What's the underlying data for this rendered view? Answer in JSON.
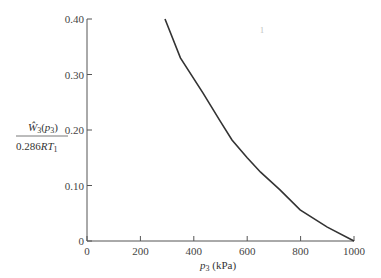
{
  "chart_data": {
    "type": "line",
    "title": "",
    "xlabel": "p3 (kPa)",
    "ylabel": "W3(p3) / 0.286 R T1",
    "ylabel_num": "Ŵ3(p3)",
    "ylabel_den": "0.286RT1",
    "xlim": [
      0,
      1000
    ],
    "ylim": [
      0,
      0.4
    ],
    "xticks": [
      "0",
      "200",
      "400",
      "600",
      "800",
      "1000"
    ],
    "yticks": [
      "0",
      "0.10",
      "0.20",
      "0.30",
      "0.40"
    ],
    "grid": false,
    "series": [
      {
        "name": "W3(p3)/0.286RT1",
        "x": [
          292,
          350,
          434,
          500,
          543,
          600,
          650,
          723,
          798,
          900,
          1000
        ],
        "y": [
          0.4,
          0.33,
          0.267,
          0.215,
          0.182,
          0.15,
          0.124,
          0.092,
          0.056,
          0.025,
          0.0
        ]
      }
    ]
  }
}
